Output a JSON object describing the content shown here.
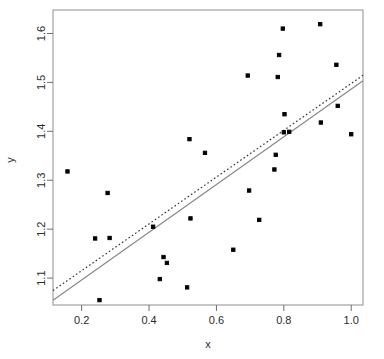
{
  "chart_data": {
    "type": "scatter",
    "title": "",
    "xlabel": "x",
    "ylabel": "y",
    "xlim": [
      0.115,
      1.035
    ],
    "ylim": [
      1.045,
      1.648
    ],
    "xticks": [
      0.2,
      0.4,
      0.6,
      0.8,
      1.0
    ],
    "xtick_labels": [
      "0.2",
      "0.4",
      "0.6",
      "0.8",
      "1.0"
    ],
    "yticks": [
      1.1,
      1.2,
      1.3,
      1.4,
      1.5,
      1.6
    ],
    "ytick_labels": [
      "1.1",
      "1.2",
      "1.3",
      "1.4",
      "1.5",
      "1.6"
    ],
    "grid": false,
    "legend": null,
    "box": true,
    "point_color": "#000000",
    "point_size": 3.4,
    "points": [
      {
        "x": 0.158,
        "y": 1.318
      },
      {
        "x": 0.24,
        "y": 1.181
      },
      {
        "x": 0.253,
        "y": 1.055
      },
      {
        "x": 0.277,
        "y": 1.274
      },
      {
        "x": 0.283,
        "y": 1.182
      },
      {
        "x": 0.412,
        "y": 1.205
      },
      {
        "x": 0.432,
        "y": 1.098
      },
      {
        "x": 0.443,
        "y": 1.143
      },
      {
        "x": 0.453,
        "y": 1.131
      },
      {
        "x": 0.513,
        "y": 1.081
      },
      {
        "x": 0.52,
        "y": 1.384
      },
      {
        "x": 0.523,
        "y": 1.222
      },
      {
        "x": 0.566,
        "y": 1.356
      },
      {
        "x": 0.65,
        "y": 1.158
      },
      {
        "x": 0.693,
        "y": 1.514
      },
      {
        "x": 0.697,
        "y": 1.279
      },
      {
        "x": 0.727,
        "y": 1.219
      },
      {
        "x": 0.772,
        "y": 1.322
      },
      {
        "x": 0.776,
        "y": 1.352
      },
      {
        "x": 0.782,
        "y": 1.511
      },
      {
        "x": 0.786,
        "y": 1.556
      },
      {
        "x": 0.797,
        "y": 1.61
      },
      {
        "x": 0.8,
        "y": 1.398
      },
      {
        "x": 0.802,
        "y": 1.435
      },
      {
        "x": 0.816,
        "y": 1.399
      },
      {
        "x": 0.908,
        "y": 1.619
      },
      {
        "x": 0.91,
        "y": 1.418
      },
      {
        "x": 0.956,
        "y": 1.536
      },
      {
        "x": 0.96,
        "y": 1.452
      },
      {
        "x": 1.0,
        "y": 1.394
      }
    ],
    "lines": [
      {
        "name": "ols-fit-solid",
        "style": "solid",
        "color": "#888888",
        "width": 1.2,
        "endpoints": [
          {
            "x": 0.115,
            "y": 1.0545
          },
          {
            "x": 1.035,
            "y": 1.5035
          }
        ]
      },
      {
        "name": "robust-fit-dotted",
        "style": "dotted",
        "color": "#333333",
        "width": 1.2,
        "endpoints": [
          {
            "x": 0.115,
            "y": 1.0745
          },
          {
            "x": 1.035,
            "y": 1.5145
          }
        ]
      }
    ]
  },
  "axes": {
    "x_label": "x",
    "y_label": "y"
  }
}
